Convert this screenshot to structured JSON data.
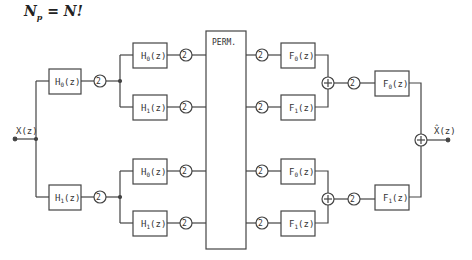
{
  "title": {
    "lhs": "N",
    "sub": "p",
    "rhs": "= N!"
  },
  "input_label": "X(z)",
  "output_label": "X̂(z)",
  "perm_label": "PERM.",
  "stage1": [
    {
      "label": "H",
      "sub": "0",
      "arg": "(z)",
      "decimator": "2↓"
    },
    {
      "label": "H",
      "sub": "1",
      "arg": "(z)",
      "decimator": "2↓"
    }
  ],
  "stage2": [
    {
      "label": "H",
      "sub": "0",
      "arg": "(z)",
      "decimator": "2↓"
    },
    {
      "label": "H",
      "sub": "1",
      "arg": "(z)",
      "decimator": "2↓"
    },
    {
      "label": "H",
      "sub": "0",
      "arg": "(z)",
      "decimator": "2↓"
    },
    {
      "label": "H",
      "sub": "1",
      "arg": "(z)",
      "decimator": "2↓"
    }
  ],
  "synth2": [
    {
      "label": "F",
      "sub": "0",
      "arg": "(z)",
      "interpolator": "2↑"
    },
    {
      "label": "F",
      "sub": "1",
      "arg": "(z)",
      "interpolator": "2↑"
    },
    {
      "label": "F",
      "sub": "0",
      "arg": "(z)",
      "interpolator": "2↑"
    },
    {
      "label": "F",
      "sub": "1",
      "arg": "(z)",
      "interpolator": "2↑"
    }
  ],
  "synth1": [
    {
      "label": "F",
      "sub": "0",
      "arg": "(z)",
      "interpolator": "2↑"
    },
    {
      "label": "F",
      "sub": "1",
      "arg": "(z)",
      "interpolator": "2↑"
    }
  ],
  "sum_symbol": "+",
  "colors": {
    "line": "#444444",
    "background": "#ffffff"
  }
}
